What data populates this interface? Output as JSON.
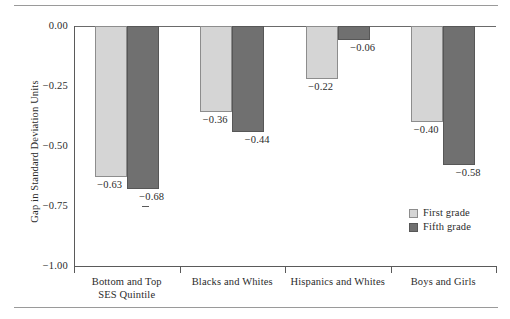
{
  "chart_data": {
    "type": "bar",
    "title": "",
    "xlabel": "",
    "ylabel": "Gap in Standard Deviation Units",
    "ylim": [
      -1.0,
      0.0
    ],
    "yticks": [
      "0.00",
      "−0.25",
      "−0.50",
      "−0.75",
      "−1.00"
    ],
    "ytick_values": [
      0.0,
      -0.25,
      -0.5,
      -0.75,
      -1.0
    ],
    "grid": false,
    "legend_position": "inside-bottom-right",
    "categories": [
      "Bottom and Top SES Quintile",
      "Blacks and Whites",
      "Hispanics and Whites",
      "Boys and Girls"
    ],
    "category_lines": [
      [
        "Bottom and Top",
        "SES Quintile"
      ],
      [
        "Blacks and Whites"
      ],
      [
        "Hispanics and Whites"
      ],
      [
        "Boys and Girls"
      ]
    ],
    "series": [
      {
        "name": "First grade",
        "color": "#d5d5d5",
        "values": [
          -0.63,
          -0.36,
          -0.22,
          -0.4
        ],
        "labels": [
          "−0.63",
          "−0.36",
          "−0.22",
          "−0.40"
        ]
      },
      {
        "name": "Fifth grade",
        "color": "#707070",
        "values": [
          -0.68,
          -0.44,
          -0.06,
          -0.58
        ],
        "labels": [
          "−0.68",
          "−0.44",
          "−0.06",
          "−0.58"
        ]
      }
    ]
  },
  "legend": {
    "items": [
      {
        "label": "First grade",
        "swatch": "light-gray-swatch"
      },
      {
        "label": "Fifth grade",
        "swatch": "dark-gray-swatch"
      }
    ]
  }
}
